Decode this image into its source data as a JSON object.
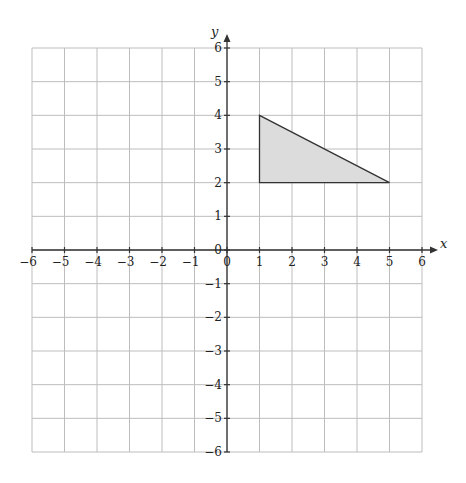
{
  "chart_data": {
    "type": "scatter",
    "title": "",
    "xlabel": "x",
    "ylabel": "y",
    "xlim": [
      -6,
      6
    ],
    "ylim": [
      -6,
      6
    ],
    "grid": true,
    "x_ticks": [
      -6,
      -5,
      -4,
      -3,
      -2,
      -1,
      0,
      1,
      2,
      3,
      4,
      5,
      6
    ],
    "y_ticks": [
      -6,
      -5,
      -4,
      -3,
      -2,
      -1,
      0,
      1,
      2,
      3,
      4,
      5,
      6
    ],
    "x_tick_labels": [
      "−6",
      "−5",
      "−4",
      "−3",
      "−2",
      "−1",
      "0",
      "1",
      "2",
      "3",
      "4",
      "5",
      "6"
    ],
    "y_tick_labels": [
      "−6",
      "−5",
      "−4",
      "−3",
      "−2",
      "−1",
      "0",
      "1",
      "2",
      "3",
      "4",
      "5",
      "6"
    ],
    "shapes": [
      {
        "name": "triangle",
        "type": "polygon",
        "vertices": [
          [
            1,
            4
          ],
          [
            1,
            2
          ],
          [
            5,
            2
          ]
        ],
        "fill": "#dcdcdc",
        "stroke": "#333333"
      }
    ],
    "legend": null
  },
  "colors": {
    "grid": "#bdbdbd",
    "axis": "#333333",
    "shape_fill": "#dcdcdc",
    "shape_stroke": "#333333"
  },
  "labels": {
    "x_axis": "x",
    "y_axis": "y"
  }
}
